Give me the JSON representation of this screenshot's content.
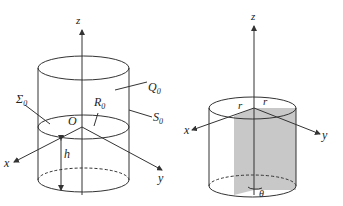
{
  "left_figure": {
    "axes": {
      "z": "z",
      "x": "x",
      "y": "y",
      "origin": "O"
    },
    "labels": {
      "Q": "Q",
      "Q_sub": "0",
      "S": "S",
      "S_sub": "0",
      "Sigma": "Σ",
      "Sigma_sub": "0",
      "R": "R",
      "R_sub": "0",
      "h": "h"
    }
  },
  "right_figure": {
    "axes": {
      "z": "z",
      "x": "x",
      "y": "y"
    },
    "labels": {
      "r_left": "r",
      "r_right": "r",
      "theta": "θ"
    },
    "shade_color": "#c8c8c8"
  },
  "colors": {
    "line": "#333333",
    "background": "#ffffff"
  }
}
